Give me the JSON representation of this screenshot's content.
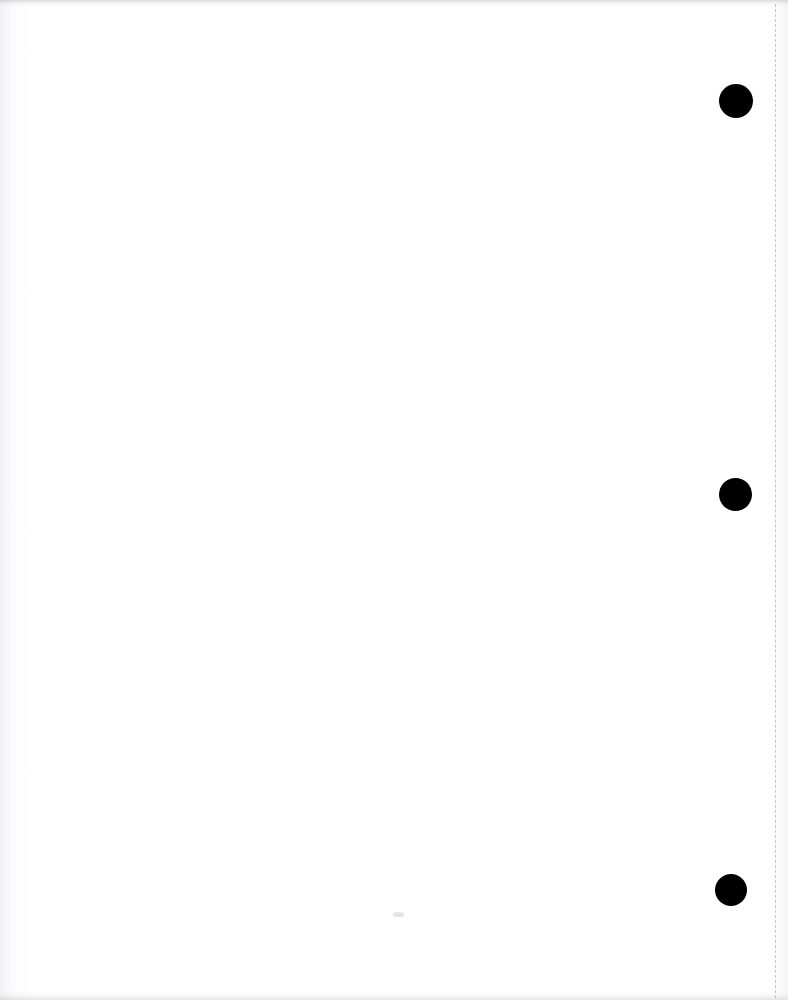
{
  "document": {
    "kind": "scanned-page",
    "page_state": "blank",
    "body_text": "",
    "width_px": 788,
    "height_px": 1000,
    "background_color": "#ffffff"
  },
  "artifacts": {
    "ink_color": "#000000",
    "rule_color": "#787a80",
    "edge_shadow_color": "#8c8c91"
  },
  "punch_holes": [
    {
      "name": "punch-hole-top",
      "cx": 736,
      "cy": 101,
      "d": 34,
      "color": "#000000"
    },
    {
      "name": "punch-hole-middle",
      "cx": 735,
      "cy": 494,
      "d": 33,
      "color": "#000000"
    },
    {
      "name": "punch-hole-bottom",
      "cx": 731,
      "cy": 890,
      "d": 32,
      "color": "#000000"
    }
  ],
  "margin_rule": {
    "name": "dashed-margin-rule",
    "x": 776,
    "y_start": 4,
    "y_end": 998,
    "style": "dashed",
    "color": "#787a80"
  },
  "speck": {
    "name": "stray-speck",
    "x": 398,
    "y": 915
  }
}
